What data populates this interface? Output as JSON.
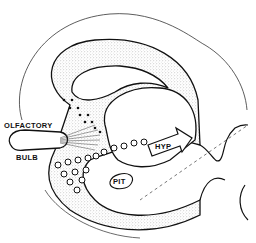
{
  "diagram": {
    "labels": {
      "olfactory": "OLFACTORY",
      "bulb": "BULB",
      "hyp": "HYP",
      "pit": "PIT"
    },
    "colors": {
      "outline": "#111111",
      "stipple": "#bdbdbd",
      "background": "#ffffff"
    }
  }
}
